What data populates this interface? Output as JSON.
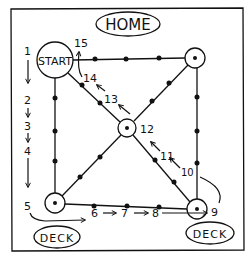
{
  "diagram": {
    "title_label": "HOME",
    "start_label": "START",
    "deck_left_label": "DECK",
    "deck_right_label": "DECK",
    "colors": {
      "ink": "#111111",
      "paper": "#ffffff"
    },
    "step_numbers": {
      "s1": "1",
      "s2": "2",
      "s3": "3",
      "s4": "4",
      "s5": "5",
      "s6": "6",
      "s7": "7",
      "s8": "8",
      "s9": "9",
      "s10": "10",
      "s11": "11",
      "s12": "12",
      "s13": "13",
      "s14": "14",
      "s15": "15"
    },
    "nodes": [
      {
        "id": "start",
        "label": "START",
        "x": 55,
        "y": 60
      },
      {
        "id": "top-right",
        "x": 195,
        "y": 58
      },
      {
        "id": "center",
        "x": 127,
        "y": 128
      },
      {
        "id": "bottom-left",
        "x": 55,
        "y": 203
      },
      {
        "id": "bottom-right",
        "x": 197,
        "y": 209
      }
    ],
    "edges": [
      {
        "from": "start",
        "to": "top-right",
        "dots": 3
      },
      {
        "from": "start",
        "to": "bottom-left",
        "dots": 3
      },
      {
        "from": "bottom-left",
        "to": "bottom-right",
        "dots": 3
      },
      {
        "from": "top-right",
        "to": "bottom-right",
        "dots": 3
      },
      {
        "from": "start",
        "to": "center",
        "dots": 2
      },
      {
        "from": "center",
        "to": "top-right",
        "dots": 2
      },
      {
        "from": "center",
        "to": "bottom-left",
        "dots": 2
      },
      {
        "from": "center",
        "to": "bottom-right",
        "dots": 2
      }
    ]
  }
}
